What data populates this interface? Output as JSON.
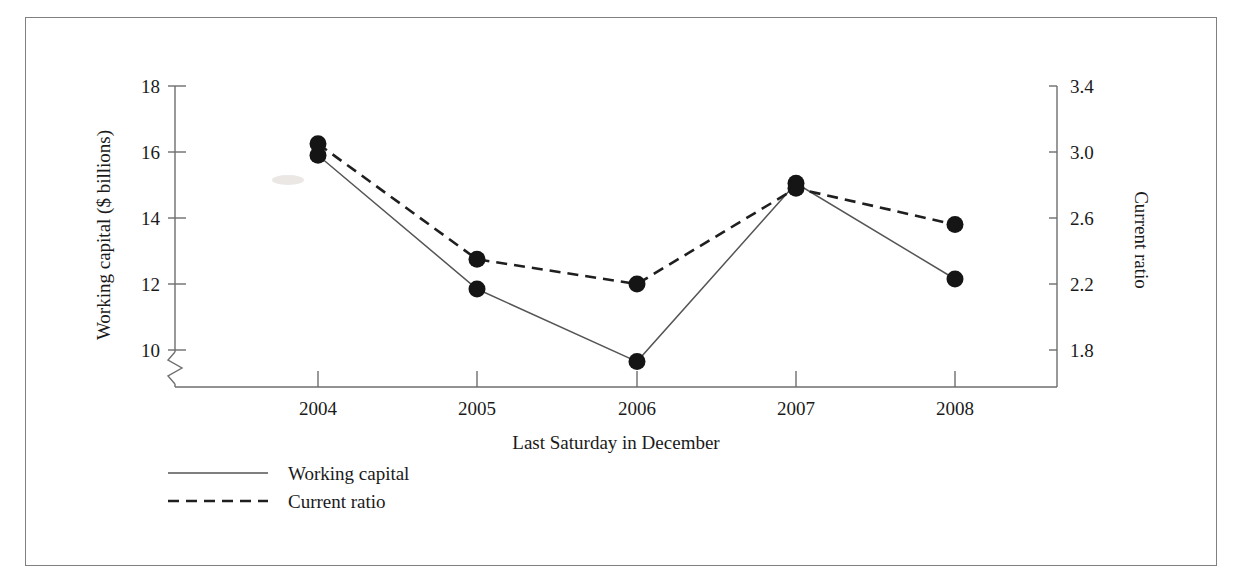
{
  "figure": {
    "background_color": "#ffffff",
    "frame_color": "#808080",
    "ink_color": "#1a1a1a"
  },
  "chart_data": {
    "type": "line",
    "title": "",
    "subtitle": "",
    "xlabel": "Last Saturday in December",
    "categories": [
      "2004",
      "2005",
      "2006",
      "2007",
      "2008"
    ],
    "x_tick_labels": [
      "2004",
      "2005",
      "2006",
      "2007",
      "2008"
    ],
    "grid": false,
    "legend_position": "bottom-left",
    "axes": [
      {
        "id": "left",
        "label": "Working capital ($ billions)",
        "ticks": [
          18,
          16,
          14,
          12,
          10
        ],
        "tick_labels": [
          "18",
          "16",
          "14",
          "12",
          "10"
        ],
        "ylim": [
          10,
          18
        ],
        "axis_break": true
      },
      {
        "id": "right",
        "label": "Current ratio",
        "ticks": [
          3.4,
          3.0,
          2.6,
          2.2,
          1.8
        ],
        "tick_labels": [
          "3.4",
          "3.0",
          "2.6",
          "2.2",
          "1.8"
        ],
        "ylim": [
          1.8,
          3.4
        ],
        "axis_break": false
      }
    ],
    "series": [
      {
        "name": "Working capital",
        "axis": "left",
        "style": "solid",
        "marker": "filled-circle",
        "color": "#555555",
        "values": [
          15.9,
          11.85,
          9.65,
          15.05,
          12.15
        ]
      },
      {
        "name": "Current ratio",
        "axis": "right",
        "style": "dashed",
        "marker": "filled-circle",
        "color": "#1f1f1f",
        "values": [
          3.05,
          2.35,
          2.2,
          2.78,
          2.56
        ]
      }
    ]
  },
  "legend": {
    "items": [
      {
        "label": "Working capital",
        "style": "solid"
      },
      {
        "label": "Current ratio",
        "style": "dashed"
      }
    ]
  }
}
